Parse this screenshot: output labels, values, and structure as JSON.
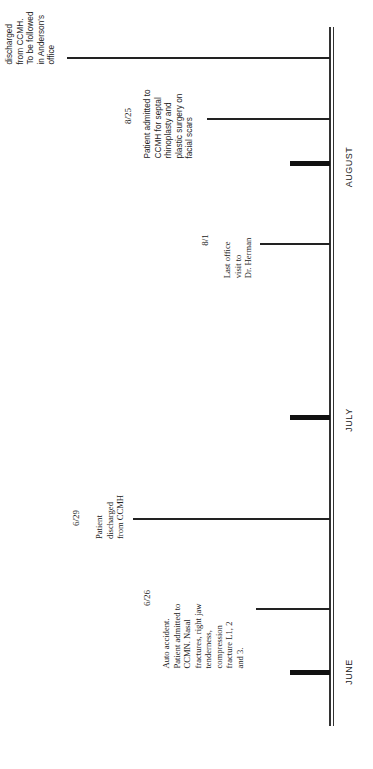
{
  "timeline": {
    "months": [
      {
        "label": "JUNE"
      },
      {
        "label": "JULY"
      },
      {
        "label": "AUGUST"
      }
    ],
    "events": [
      {
        "date": "6/26",
        "text": "Auto accident.\nPatient admitted to\nCCMN. Nasal\nfractures, right jaw\ntenderness,\ncompression\nfracture L1, 2\nand 3."
      },
      {
        "date": "6/29",
        "text": "Patient\ndischarged\nfrom CCMH"
      },
      {
        "date": "8/1",
        "text": "Last office\nvisit to\nDr. Herman"
      },
      {
        "date": "8/25",
        "text": "Patient admitted to\nCCMH for septal\nrhinoplasty and\nplastic surgery on\nfacial scars"
      },
      {
        "date": "",
        "text": "discharged\nfrom CCMH.\nTo be followed\nin Anderson's\noffice"
      }
    ]
  }
}
